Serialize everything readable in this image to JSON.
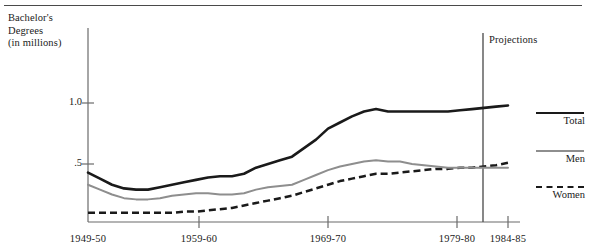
{
  "figure": {
    "y_axis_title": "Bachelor's\nDegrees\n(in millions)",
    "projections_label": "Projections"
  },
  "legend": {
    "position": "right",
    "entries": [
      {
        "label": "Total",
        "style": "solid-thick-black",
        "color": "#1a1a1a"
      },
      {
        "label": "Men",
        "style": "solid-gray",
        "color": "#8e8e8e"
      },
      {
        "label": "Women",
        "style": "dashed-black",
        "color": "#1a1a1a"
      }
    ]
  },
  "chart_data": {
    "type": "line",
    "title": "",
    "subtitle": "",
    "xlabel": "",
    "ylabel": "Bachelor's Degrees (in millions)",
    "grid": false,
    "legend_position": "right",
    "annotations": [
      {
        "text": "Projections",
        "x": "1979-80",
        "type": "vertical-divider-label"
      }
    ],
    "xlim": [
      "1949-50",
      "1985-86"
    ],
    "ylim": [
      0.0,
      1.25
    ],
    "yticks": [
      0.5,
      1.0
    ],
    "ytick_labels": [
      ".5",
      "1.0"
    ],
    "xticks": [
      "1949-50",
      "1959-60",
      "1969-70",
      "1979-80",
      "1984-85"
    ],
    "xtick_labels": [
      "1949-50",
      "1959-60",
      "1969-70",
      "1979-80",
      "1984-85"
    ],
    "projection_start": "1979-80",
    "x": [
      "1949-50",
      "1950-51",
      "1951-52",
      "1952-53",
      "1953-54",
      "1954-55",
      "1955-56",
      "1956-57",
      "1957-58",
      "1958-59",
      "1959-60",
      "1960-61",
      "1961-62",
      "1962-63",
      "1963-64",
      "1964-65",
      "1965-66",
      "1966-67",
      "1967-68",
      "1968-69",
      "1969-70",
      "1970-71",
      "1971-72",
      "1972-73",
      "1973-74",
      "1974-75",
      "1975-76",
      "1976-77",
      "1977-78",
      "1978-79",
      "1979-80",
      "1980-81",
      "1981-82",
      "1982-83",
      "1983-84",
      "1984-85"
    ],
    "series": [
      {
        "name": "Total",
        "color": "#1a1a1a",
        "style": "solid-thick",
        "values": [
          0.43,
          0.38,
          0.33,
          0.3,
          0.29,
          0.29,
          0.31,
          0.33,
          0.35,
          0.37,
          0.39,
          0.4,
          0.4,
          0.42,
          0.47,
          0.5,
          0.53,
          0.56,
          0.63,
          0.7,
          0.79,
          0.84,
          0.89,
          0.93,
          0.95,
          0.93,
          0.93,
          0.93,
          0.93,
          0.93,
          0.93,
          0.94,
          0.95,
          0.96,
          0.97,
          0.98
        ]
      },
      {
        "name": "Men",
        "color": "#8e8e8e",
        "style": "solid",
        "values": [
          0.33,
          0.29,
          0.25,
          0.22,
          0.21,
          0.21,
          0.22,
          0.24,
          0.25,
          0.26,
          0.26,
          0.25,
          0.25,
          0.26,
          0.29,
          0.31,
          0.32,
          0.33,
          0.37,
          0.41,
          0.45,
          0.48,
          0.5,
          0.52,
          0.53,
          0.52,
          0.52,
          0.5,
          0.49,
          0.48,
          0.47,
          0.47,
          0.47,
          0.47,
          0.47,
          0.47
        ]
      },
      {
        "name": "Women",
        "color": "#1a1a1a",
        "style": "dashed",
        "values": [
          0.1,
          0.1,
          0.1,
          0.1,
          0.1,
          0.1,
          0.1,
          0.1,
          0.11,
          0.11,
          0.12,
          0.13,
          0.14,
          0.16,
          0.18,
          0.2,
          0.22,
          0.24,
          0.27,
          0.3,
          0.33,
          0.36,
          0.38,
          0.4,
          0.42,
          0.42,
          0.43,
          0.44,
          0.45,
          0.46,
          0.46,
          0.47,
          0.47,
          0.48,
          0.49,
          0.51
        ]
      }
    ]
  }
}
